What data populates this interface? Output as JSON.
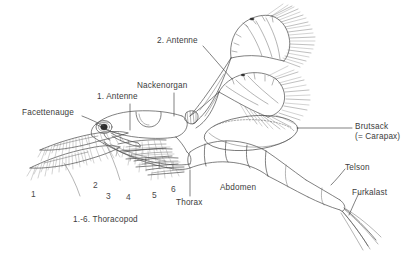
{
  "figure": {
    "background_color": "#ffffff",
    "ink_color": "#4a4a4a",
    "text_color": "#3c3c3c"
  },
  "labels": {
    "facettenauge": "Facettenauge",
    "antenne_1": "1. Antenne",
    "nackenorgan": "Nackenorgan",
    "antenne_2": "2. Antenne",
    "brutsack": "Brutsack",
    "carapax": "(= Carapax)",
    "telson": "Telson",
    "furkalast": "Furkalast",
    "abdomen": "Abdomen",
    "thorax": "Thorax",
    "thoracopod_caption": "1.-6. Thoracopod"
  },
  "thoracopod_numbers": [
    {
      "value": "1"
    },
    {
      "value": "2"
    },
    {
      "value": "3"
    },
    {
      "value": "4"
    },
    {
      "value": "5"
    },
    {
      "value": "6"
    }
  ]
}
